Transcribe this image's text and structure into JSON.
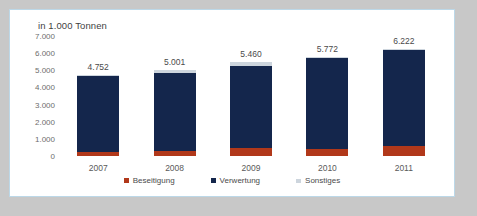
{
  "chart_data": {
    "type": "bar",
    "subtype": "stacked-column",
    "title": "in 1.000 Tonnen",
    "xlabel": "",
    "ylabel": "",
    "ylim": [
      0,
      7000
    ],
    "ytick_labels": [
      "7.000",
      "6.000",
      "5.000",
      "4.000",
      "3.000",
      "2.000",
      "1.000",
      "0"
    ],
    "ytick_values": [
      7000,
      6000,
      5000,
      4000,
      3000,
      2000,
      1000,
      0
    ],
    "grid": false,
    "legend_position": "bottom",
    "categories": [
      "2007",
      "2008",
      "2009",
      "2010",
      "2011"
    ],
    "series": [
      {
        "name": "Beseitigung",
        "color": "#b1381a",
        "values": [
          230,
          280,
          470,
          420,
          610
        ]
      },
      {
        "name": "Verwertung",
        "color": "#14264c",
        "values": [
          4452,
          4591,
          4810,
          5282,
          5562
        ]
      },
      {
        "name": "Sonstiges",
        "color": "#cdd5dd",
        "values": [
          70,
          130,
          180,
          70,
          50
        ]
      }
    ],
    "totals": [
      4752,
      5001,
      5460,
      5772,
      6222
    ],
    "total_labels": [
      "4.752",
      "5.001",
      "5.460",
      "5.772",
      "6.222"
    ]
  },
  "legend": {
    "items": [
      {
        "label": "Beseitigung",
        "color": "#b1381a"
      },
      {
        "label": "Verwertung",
        "color": "#14264c"
      },
      {
        "label": "Sonstiges",
        "color": "#cdd5dd"
      }
    ]
  },
  "colors": {
    "frame_border": "#bcd8e8",
    "page_background": "#c8c8c8",
    "plot_background": "#ffffff",
    "beseitigung": "#b1381a",
    "verwertung": "#14264c",
    "sonstiges": "#cdd5dd"
  }
}
